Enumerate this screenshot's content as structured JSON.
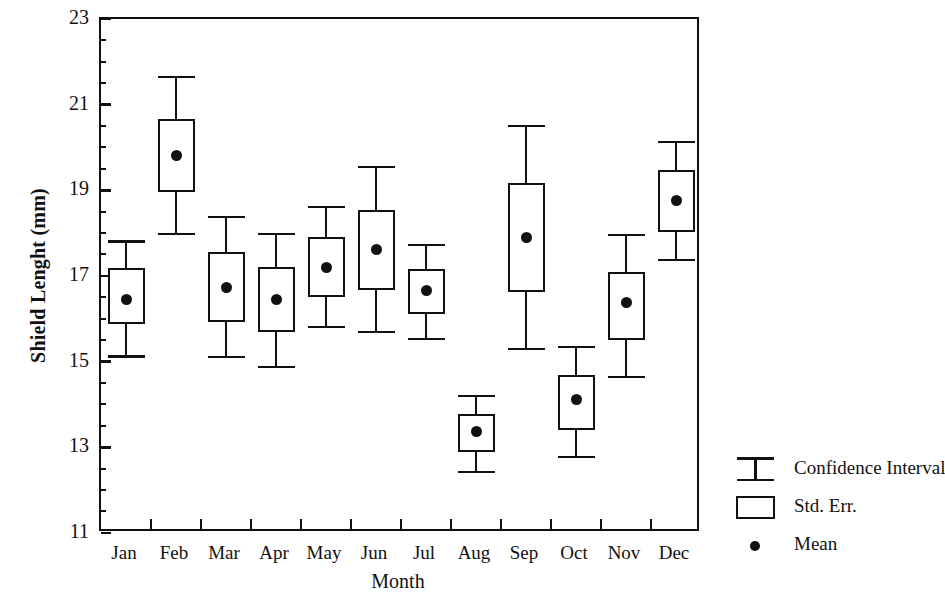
{
  "chart_data": {
    "type": "box",
    "title": "",
    "xlabel": "Month",
    "ylabel": "Shield Lenght (mm)",
    "ylim": [
      11,
      23
    ],
    "ytick_labels": [
      "11",
      "13",
      "15",
      "17",
      "19",
      "21",
      "23"
    ],
    "ytick_values": [
      11,
      13,
      15,
      17,
      19,
      21,
      23
    ],
    "minor_tick_step": 0.5,
    "grid": false,
    "categories": [
      "Jan",
      "Feb",
      "Mar",
      "Apr",
      "May",
      "Jun",
      "Jul",
      "Aug",
      "Sep",
      "Oct",
      "Nov",
      "Dec"
    ],
    "legend_position": "right-outside",
    "series": [
      {
        "name": "Mean",
        "values": [
          16.45,
          19.82,
          16.74,
          16.46,
          17.19,
          17.63,
          16.67,
          13.36,
          17.91,
          14.11,
          16.39,
          18.77
        ]
      },
      {
        "name": "Std. Err.",
        "upper": [
          17.18,
          20.66,
          17.56,
          17.21,
          17.91,
          18.54,
          17.16,
          13.78,
          19.17,
          14.69,
          17.09,
          19.47
        ],
        "lower": [
          15.88,
          18.96,
          15.92,
          15.69,
          16.51,
          16.67,
          16.11,
          12.89,
          16.62,
          13.41,
          15.51,
          18.03
        ]
      },
      {
        "name": "Confidence Interval",
        "upper": [
          17.8,
          21.65,
          18.38,
          17.98,
          18.61,
          19.54,
          17.72,
          14.2,
          20.5,
          15.34,
          17.96,
          20.13
        ],
        "lower": [
          15.12,
          17.98,
          15.11,
          14.88,
          15.81,
          15.69,
          15.53,
          12.42,
          15.3,
          12.78,
          14.64,
          17.37
        ]
      }
    ]
  },
  "axes": {
    "y_title": "Shield Lenght (mm)",
    "x_title": "Month"
  },
  "legend": {
    "items": [
      {
        "label": "Confidence Interval",
        "key": "ibar-icon"
      },
      {
        "label": "Std. Err.",
        "key": "rectangle-icon"
      },
      {
        "label": "Mean",
        "key": "dot-icon"
      }
    ]
  },
  "colors": {
    "ink": "#111111",
    "background": "#ffffff"
  }
}
